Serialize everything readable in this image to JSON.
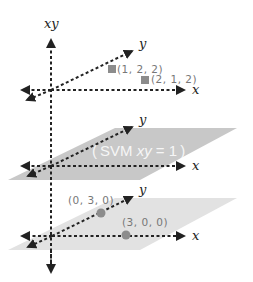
{
  "diagram": {
    "colors": {
      "axis": "#222222",
      "plane": "#c8c8c8",
      "plane_light": "#e0e0e0",
      "marker": "#8c8c8c",
      "label": "#777777",
      "plane_text": "#ffffff"
    },
    "vertical_axis": {
      "label": "xy"
    },
    "top_axes": {
      "x_label": "x",
      "y_label": "y",
      "points": [
        {
          "label": "(1, 2, 2)",
          "shape": "square"
        },
        {
          "label": "(2, 1, 2)",
          "shape": "square"
        }
      ]
    },
    "middle_plane": {
      "x_label": "x",
      "y_label": "y",
      "label_open": "(",
      "label_main": "SVM ",
      "label_var": "xy",
      "label_eq": " = 1",
      "label_close": ")"
    },
    "bottom_plane": {
      "x_label": "x",
      "y_label": "y",
      "points": [
        {
          "label": "(0, 3, 0)",
          "shape": "circle"
        },
        {
          "label": "(3, 0, 0)",
          "shape": "circle"
        }
      ]
    }
  }
}
